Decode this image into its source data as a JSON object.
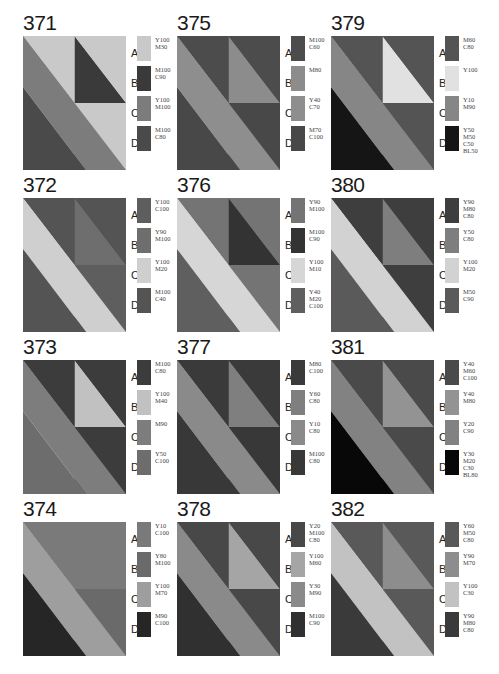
{
  "page": {
    "panels": [
      {
        "number": "371",
        "swatches": [
          {
            "letter": "A",
            "label": "Y100\nM30",
            "gray": "#c9c9c9"
          },
          {
            "letter": "B",
            "label": "M100\nC90",
            "gray": "#3a3a3a"
          },
          {
            "letter": "C",
            "label": "Y100\nM100",
            "gray": "#7c7c7c"
          },
          {
            "letter": "D",
            "label": "M100\nC80",
            "gray": "#4a4a4a"
          }
        ],
        "regions": {
          "tl": "A",
          "tri": "B",
          "tr_low": "A",
          "band": "C",
          "bl": "D"
        }
      },
      {
        "number": "372",
        "swatches": [
          {
            "letter": "A",
            "label": "Y100\nC100",
            "gray": "#5e5e5e"
          },
          {
            "letter": "B",
            "label": "Y90\nM100",
            "gray": "#6e6e6e"
          },
          {
            "letter": "C",
            "label": "Y100\nM20",
            "gray": "#cfcfcf"
          },
          {
            "letter": "D",
            "label": "M100\nC40",
            "gray": "#545454"
          }
        ],
        "regions": {
          "tl": "D",
          "tri": "B",
          "tr_low": "A",
          "band": "C",
          "bl": "D"
        }
      },
      {
        "number": "373",
        "swatches": [
          {
            "letter": "A",
            "label": "M100\nC80",
            "gray": "#3c3c3c"
          },
          {
            "letter": "B",
            "label": "Y100\nM40",
            "gray": "#c1c1c1"
          },
          {
            "letter": "C",
            "label": "M90",
            "gray": "#7d7d7d"
          },
          {
            "letter": "D",
            "label": "Y50\nC100",
            "gray": "#6d6d6d"
          }
        ],
        "regions": {
          "tl": "A",
          "tri": "B",
          "tr_low": "A",
          "band": "C",
          "bl": "D"
        }
      },
      {
        "number": "374",
        "swatches": [
          {
            "letter": "A",
            "label": "Y10\nC100",
            "gray": "#7a7a7a"
          },
          {
            "letter": "B",
            "label": "Y80\nM100",
            "gray": "#6a6a6a"
          },
          {
            "letter": "C",
            "label": "Y100\nM70",
            "gray": "#9e9e9e"
          },
          {
            "letter": "D",
            "label": "M90\nC100",
            "gray": "#262626"
          }
        ],
        "regions": {
          "tl": "A",
          "tri": "A",
          "tr_low": "B",
          "band": "C",
          "bl": "D"
        }
      },
      {
        "number": "375",
        "swatches": [
          {
            "letter": "A",
            "label": "M100\nC60",
            "gray": "#4c4c4c"
          },
          {
            "letter": "B",
            "label": "M80",
            "gray": "#8c8c8c"
          },
          {
            "letter": "C",
            "label": "Y40\nC70",
            "gray": "#8e8e8e"
          },
          {
            "letter": "D",
            "label": "M70\nC100",
            "gray": "#484848"
          }
        ],
        "regions": {
          "tl": "A",
          "tri": "B",
          "tr_low": "D",
          "band": "C",
          "bl": "D"
        }
      },
      {
        "number": "376",
        "swatches": [
          {
            "letter": "A",
            "label": "Y90\nM100",
            "gray": "#747474"
          },
          {
            "letter": "B",
            "label": "M100\nC90",
            "gray": "#333333"
          },
          {
            "letter": "C",
            "label": "Y100\nM10",
            "gray": "#d6d6d6"
          },
          {
            "letter": "D",
            "label": "Y40\nM20\nC100",
            "gray": "#5f5f5f"
          }
        ],
        "regions": {
          "tl": "A",
          "tri": "B",
          "tr_low": "A",
          "band": "C",
          "bl": "D"
        }
      },
      {
        "number": "377",
        "swatches": [
          {
            "letter": "A",
            "label": "M80\nC100",
            "gray": "#3a3a3a"
          },
          {
            "letter": "B",
            "label": "Y60\nC80",
            "gray": "#7f7f7f"
          },
          {
            "letter": "C",
            "label": "Y10\nC80",
            "gray": "#8a8a8a"
          },
          {
            "letter": "D",
            "label": "M100\nC80",
            "gray": "#383838"
          }
        ],
        "regions": {
          "tl": "A",
          "tri": "B",
          "tr_low": "D",
          "band": "C",
          "bl": "D"
        }
      },
      {
        "number": "378",
        "swatches": [
          {
            "letter": "A",
            "label": "Y20\nM100\nC80",
            "gray": "#484848"
          },
          {
            "letter": "B",
            "label": "Y100\nM60",
            "gray": "#a5a5a5"
          },
          {
            "letter": "C",
            "label": "Y30\nM90",
            "gray": "#8a8a8a"
          },
          {
            "letter": "D",
            "label": "M100\nC90",
            "gray": "#303030"
          }
        ],
        "regions": {
          "tl": "A",
          "tri": "B",
          "tr_low": "A",
          "band": "C",
          "bl": "D"
        }
      },
      {
        "number": "379",
        "swatches": [
          {
            "letter": "A",
            "label": "M60\nC80",
            "gray": "#545454"
          },
          {
            "letter": "B",
            "label": "Y100",
            "gray": "#e1e1e1"
          },
          {
            "letter": "C",
            "label": "Y10\nM90",
            "gray": "#868686"
          },
          {
            "letter": "D",
            "label": "Y50\nM50\nC50\nBL50",
            "gray": "#151515"
          }
        ],
        "regions": {
          "tl": "A",
          "tri": "B",
          "tr_low": "A",
          "band": "C",
          "bl": "D"
        }
      },
      {
        "number": "380",
        "swatches": [
          {
            "letter": "A",
            "label": "Y90\nM80\nC80",
            "gray": "#3e3e3e"
          },
          {
            "letter": "B",
            "label": "Y50\nC80",
            "gray": "#7e7e7e"
          },
          {
            "letter": "C",
            "label": "Y100\nM20",
            "gray": "#d2d2d2"
          },
          {
            "letter": "D",
            "label": "M50\nC90",
            "gray": "#5a5a5a"
          }
        ],
        "regions": {
          "tl": "A",
          "tri": "B",
          "tr_low": "A",
          "band": "C",
          "bl": "D"
        }
      },
      {
        "number": "381",
        "swatches": [
          {
            "letter": "A",
            "label": "Y40\nM60\nC100",
            "gray": "#4a4a4a"
          },
          {
            "letter": "B",
            "label": "Y40\nM80",
            "gray": "#939393"
          },
          {
            "letter": "C",
            "label": "Y20\nC90",
            "gray": "#828282"
          },
          {
            "letter": "D",
            "label": "Y30\nM20\nC30\nBL80",
            "gray": "#080808"
          }
        ],
        "regions": {
          "tl": "A",
          "tri": "B",
          "tr_low": "A",
          "band": "C",
          "bl": "D"
        }
      },
      {
        "number": "382",
        "swatches": [
          {
            "letter": "A",
            "label": "Y60\nM50\nC80",
            "gray": "#595959"
          },
          {
            "letter": "B",
            "label": "Y90\nM70",
            "gray": "#8d8d8d"
          },
          {
            "letter": "C",
            "label": "Y100\nC30",
            "gray": "#c2c2c2"
          },
          {
            "letter": "D",
            "label": "Y90\nM80\nC80",
            "gray": "#3a3a3a"
          }
        ],
        "regions": {
          "tl": "A",
          "tri": "B",
          "tr_low": "A",
          "band": "C",
          "bl": "D"
        }
      }
    ]
  }
}
